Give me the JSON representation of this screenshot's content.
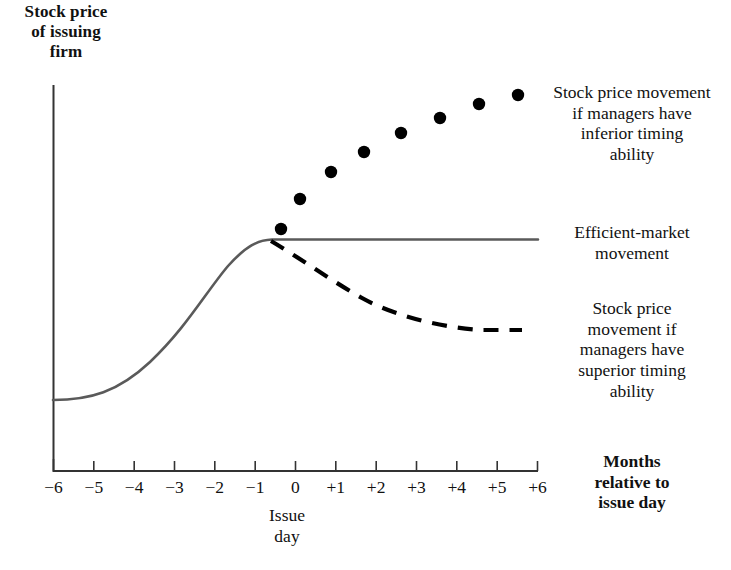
{
  "chart_data": {
    "type": "line",
    "title": "Stock price of issuing firm",
    "ylabel": "Stock price of issuing firm",
    "xlabel": "Months relative to issue day",
    "grid": false,
    "legend_position": "right",
    "x": [
      -6,
      -5,
      -4,
      -3,
      -2,
      -1,
      0,
      1,
      2,
      3,
      4,
      5,
      6
    ],
    "tick_labels": [
      "−6",
      "−5",
      "−4",
      "−3",
      "−2",
      "−1",
      "0",
      "+1",
      "+2",
      "+3",
      "+4",
      "+5",
      "+6"
    ],
    "xlim": [
      -6.2,
      6.2
    ],
    "ylim": [
      0,
      100
    ],
    "annotations": [
      {
        "name": "issue-day",
        "text": "Issue\nday",
        "x": 0
      }
    ],
    "series": [
      {
        "name": "Efficient-market movement",
        "label": "Efficient-market movement",
        "style": "solid",
        "color": "#5a5a5a",
        "x": [
          -6,
          -5,
          -4,
          -3,
          -2,
          -1,
          0,
          1,
          2,
          3,
          4,
          5,
          6
        ],
        "values": [
          21,
          24,
          31,
          42,
          56,
          68,
          73,
          73,
          73,
          73,
          73,
          73,
          73
        ]
      },
      {
        "name": "Stock price movement if managers have superior timing ability",
        "label": "Stock price movement if managers have superior timing ability",
        "style": "dashed",
        "color": "#000000",
        "x": [
          0,
          1,
          2,
          3,
          4,
          5,
          6
        ],
        "values": [
          73,
          66,
          60,
          55,
          51,
          49,
          48
        ]
      },
      {
        "name": "Stock price movement if managers have inferior timing ability",
        "label": "Stock price movement if managers have inferior timing ability",
        "style": "dotted-markers",
        "color": "#000000",
        "x": [
          0,
          1,
          2,
          3,
          4,
          5,
          6
        ],
        "values": [
          75,
          83,
          88,
          92,
          96,
          99,
          101
        ]
      }
    ]
  },
  "labels": {
    "y_axis_title": "Stock price\nof issuing\nfirm",
    "inferior": "Stock price movement\nif managers have\ninferior timing\nability",
    "efficient": "Efficient-market\nmovement",
    "superior": "Stock price\nmovement if\nmanagers have\nsuperior timing\nability",
    "x_axis_title": "Months\nrelative to\nissue day",
    "issue_day": "Issue\nday"
  },
  "axis": {
    "ticks": [
      "−6",
      "−5",
      "−4",
      "−3",
      "−2",
      "−1",
      "0",
      "+1",
      "+2",
      "+3",
      "+4",
      "+5",
      "+6"
    ]
  },
  "colors": {
    "efficient_line": "#5a5a5a",
    "dashed_line": "#000000",
    "dots": "#000000",
    "axis": "#333333",
    "text": "#111111",
    "background": "#ffffff"
  }
}
